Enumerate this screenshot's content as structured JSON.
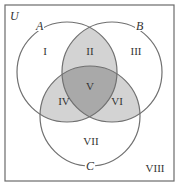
{
  "diagram": {
    "type": "venn-3",
    "universe_label": "U",
    "sets": [
      {
        "name": "A",
        "label": "A"
      },
      {
        "name": "B",
        "label": "B"
      },
      {
        "name": "C",
        "label": "C"
      }
    ],
    "regions": {
      "r1": "I",
      "r2": "II",
      "r3": "III",
      "r4": "IV",
      "r5": "V",
      "r6": "VI",
      "r7": "VII",
      "r8": "VIII"
    },
    "colors": {
      "border": "#6b6b6b",
      "circle_stroke": "#707070",
      "pair_overlap_fill": "#d3d3d3",
      "triple_overlap_fill": "#a9a9a9",
      "background": "#ffffff"
    }
  }
}
